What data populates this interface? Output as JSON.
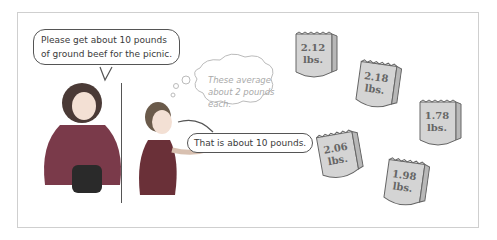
{
  "speech": {
    "mother": [
      "Please get about 10 pounds",
      "of ground beef for the picnic."
    ],
    "boy": "That is about 10 pounds."
  },
  "thought": [
    "These average",
    "about 2 pounds",
    "each."
  ],
  "bags": [
    {
      "line1": "2.12",
      "line2": "lbs.",
      "x": 294,
      "y": 30,
      "rot": 0
    },
    {
      "line1": "2.18",
      "line2": "lbs.",
      "x": 356,
      "y": 60,
      "rot": 8
    },
    {
      "line1": "1.78",
      "line2": "lbs.",
      "x": 418,
      "y": 98,
      "rot": 0
    },
    {
      "line1": "2.06",
      "line2": "lbs.",
      "x": 318,
      "y": 130,
      "rot": -10
    },
    {
      "line1": "1.98",
      "line2": "lbs.",
      "x": 384,
      "y": 158,
      "rot": 8
    }
  ],
  "colors": {
    "bag_fill": "#d4d4d4",
    "bag_side": "#b8b8b8",
    "dress": "#7a3a4a",
    "shirt": "#6a3038"
  }
}
